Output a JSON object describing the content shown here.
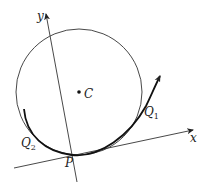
{
  "diagram": {
    "axes": {
      "x_label": "x",
      "y_label": "y"
    },
    "circle": {
      "center_label": "C"
    },
    "points": {
      "P": "P",
      "Q1": {
        "main": "Q",
        "sub": "1"
      },
      "Q2": {
        "main": "Q",
        "sub": "2"
      }
    },
    "colors": {
      "stroke": "#222222",
      "background": "#ffffff"
    }
  }
}
